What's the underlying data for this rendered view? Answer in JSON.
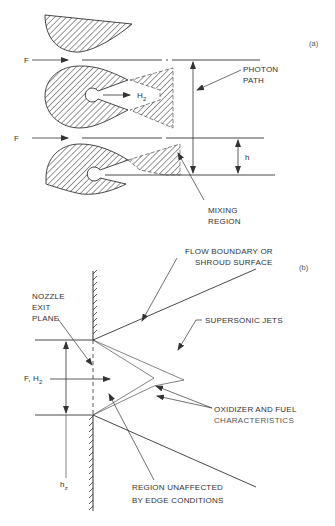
{
  "figure": {
    "panel_a": {
      "tag": "(a)",
      "labels": {
        "flow_top": "F",
        "flow_bottom": "F",
        "hydrogen": "H",
        "hydrogen_sub": "2",
        "photon_path_line1": "PHOTON",
        "photon_path_line2": "PATH",
        "height": "h",
        "mixing_region_line1": "MIXING",
        "mixing_region_line2": "REGION"
      }
    },
    "panel_b": {
      "tag": "(b)",
      "labels": {
        "flow_boundary_line1": "FLOW BOUNDARY OR",
        "flow_boundary_line2": "SHROUD SURFACE",
        "nozzle_line1": "NOZZLE",
        "nozzle_line2": "EXIT",
        "nozzle_line3": "PLANE",
        "supersonic_jets": "SUPERSONIC JETS",
        "inflow": "F, H",
        "inflow_sub": "2",
        "characteristics_line1": "OXIDIZER AND FUEL",
        "characteristics_line2": "CHARACTERISTICS",
        "region_line1": "REGION UNAFFECTED",
        "region_line2": "BY EDGE CONDITIONS",
        "height": "h",
        "height_sub": "z"
      }
    },
    "colors": {
      "ink": "#333333",
      "background": "#ffffff"
    }
  }
}
